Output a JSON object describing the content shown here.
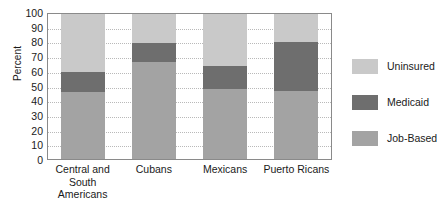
{
  "chart_data": {
    "type": "bar",
    "subtype": "stacked-bar",
    "title": "",
    "xlabel": "",
    "ylabel": "Percent",
    "ylim": [
      0,
      100
    ],
    "yticks": [
      100,
      90,
      80,
      70,
      60,
      50,
      40,
      30,
      20,
      10,
      0
    ],
    "grid": true,
    "legend_position": "right",
    "categories": [
      "Central and South\nAmericans",
      "Cubans",
      "Mexicans",
      "Puerto Ricans"
    ],
    "series": [
      {
        "name": "Job-Based",
        "color": "#a3a3a3",
        "values": [
          46,
          67,
          48,
          47
        ]
      },
      {
        "name": "Medicaid",
        "color": "#6e6e6e",
        "values": [
          14,
          13,
          16,
          34
        ]
      },
      {
        "name": "Uninsured",
        "color": "#c9c9c9",
        "values": [
          40,
          20,
          36,
          19
        ]
      }
    ],
    "legend": [
      {
        "label": "Uninsured",
        "color": "#c9c9c9"
      },
      {
        "label": "Medicaid",
        "color": "#6e6e6e"
      },
      {
        "label": "Job-Based",
        "color": "#a3a3a3"
      }
    ]
  }
}
